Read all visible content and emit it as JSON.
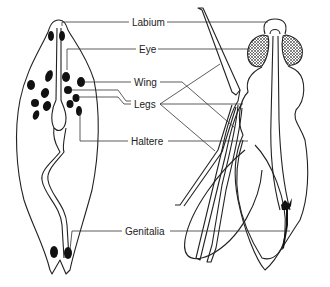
{
  "diagram": {
    "labels": [
      {
        "id": "labium",
        "text": "Labium"
      },
      {
        "id": "eye",
        "text": "Eye"
      },
      {
        "id": "wing",
        "text": "Wing"
      },
      {
        "id": "legs",
        "text": "Legs"
      },
      {
        "id": "haltere",
        "text": "Haltere"
      },
      {
        "id": "genitalia",
        "text": "Genitalia"
      }
    ],
    "colors": {
      "line": "#222222",
      "fill": "#111111",
      "background": "#ffffff"
    }
  }
}
